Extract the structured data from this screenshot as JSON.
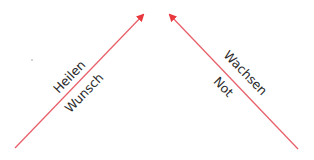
{
  "diagram": {
    "left_arrow": {
      "label_above": "Heilen",
      "label_below": "Wunsch",
      "color": "#e8383d"
    },
    "right_arrow": {
      "label_above": "Wachsen",
      "label_below": "Not",
      "color": "#e8383d"
    }
  }
}
